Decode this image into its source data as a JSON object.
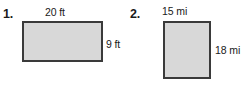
{
  "worksheet": {
    "background_color": "#ffffff",
    "figure_fill_color": "#d8d8d8",
    "figure_border_color": "#3a3a3a",
    "problems": [
      {
        "number": "1.",
        "shape": "rectangle",
        "top_label": "20 ft",
        "right_label": "9 ft",
        "width_value": 20,
        "height_value": 9,
        "unit": "ft"
      },
      {
        "number": "2.",
        "shape": "rectangle",
        "top_label": "15 mi",
        "right_label": "18 mi",
        "width_value": 15,
        "height_value": 18,
        "unit": "mi"
      }
    ]
  }
}
